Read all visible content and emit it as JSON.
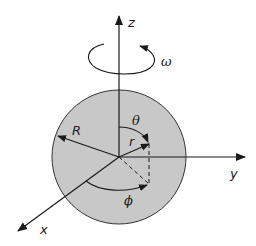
{
  "diagram": {
    "labels": {
      "z_axis": "z",
      "y_axis": "y",
      "x_axis": "x",
      "omega": "ω",
      "radius_R": "R",
      "radius_r": "r",
      "theta": "θ",
      "phi": "ϕ"
    },
    "colors": {
      "sphere_fill": "#c8c8c8",
      "stroke": "#1a1a1a",
      "background": "#ffffff"
    }
  }
}
